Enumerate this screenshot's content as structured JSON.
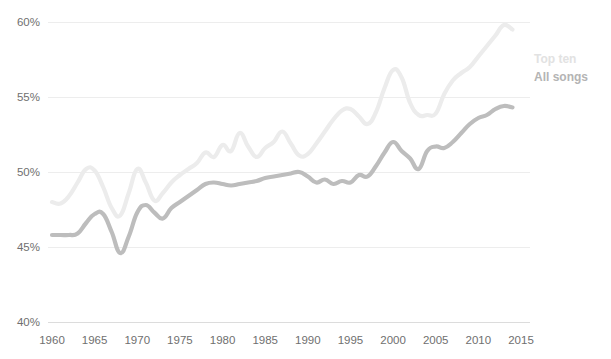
{
  "chart_data": {
    "type": "line",
    "title": "",
    "subtitle": "",
    "xlabel": "",
    "ylabel": "",
    "xlim": [
      1960,
      2016
    ],
    "ylim": [
      40,
      60
    ],
    "grid": true,
    "legend_position": "right",
    "x_ticks": [
      "1960",
      "1965",
      "1970",
      "1975",
      "1980",
      "1985",
      "1990",
      "1995",
      "2000",
      "2005",
      "2010",
      "2015"
    ],
    "x_tick_values": [
      1960,
      1965,
      1970,
      1975,
      1980,
      1985,
      1990,
      1995,
      2000,
      2005,
      2010,
      2015
    ],
    "y_ticks": [
      "40%",
      "45%",
      "50%",
      "55%",
      "60%"
    ],
    "y_tick_values": [
      40,
      45,
      50,
      55,
      60
    ],
    "x": [
      1960,
      1961,
      1962,
      1963,
      1964,
      1965,
      1966,
      1967,
      1968,
      1969,
      1970,
      1971,
      1972,
      1973,
      1974,
      1975,
      1976,
      1977,
      1978,
      1979,
      1980,
      1981,
      1982,
      1983,
      1984,
      1985,
      1986,
      1987,
      1988,
      1989,
      1990,
      1991,
      1992,
      1993,
      1994,
      1995,
      1996,
      1997,
      1998,
      1999,
      2000,
      2001,
      2002,
      2003,
      2004,
      2005,
      2006,
      2007,
      2008,
      2009,
      2010,
      2011,
      2012,
      2013,
      2014
    ],
    "series": [
      {
        "name": "Top ten",
        "color": "#ececec",
        "values": [
          48.0,
          47.9,
          48.4,
          49.3,
          50.2,
          50.1,
          49.0,
          47.6,
          47.1,
          48.6,
          50.2,
          49.3,
          48.1,
          48.6,
          49.3,
          49.8,
          50.2,
          50.6,
          51.3,
          51.0,
          51.8,
          51.4,
          52.6,
          51.7,
          51.0,
          51.6,
          52.0,
          52.7,
          51.9,
          51.1,
          51.2,
          51.9,
          52.7,
          53.5,
          54.1,
          54.2,
          53.7,
          53.2,
          54.0,
          55.6,
          56.8,
          56.3,
          54.6,
          53.8,
          53.8,
          53.9,
          55.2,
          56.1,
          56.6,
          57.0,
          57.7,
          58.4,
          59.1,
          59.8,
          59.5
        ]
      },
      {
        "name": "All songs",
        "color": "#bdbdbd",
        "values": [
          45.8,
          45.8,
          45.8,
          45.9,
          46.6,
          47.2,
          47.2,
          46.0,
          44.6,
          45.7,
          47.3,
          47.8,
          47.3,
          46.9,
          47.6,
          48.0,
          48.4,
          48.8,
          49.2,
          49.3,
          49.2,
          49.1,
          49.2,
          49.3,
          49.4,
          49.6,
          49.7,
          49.8,
          49.9,
          50.0,
          49.7,
          49.3,
          49.5,
          49.2,
          49.4,
          49.3,
          49.8,
          49.7,
          50.4,
          51.3,
          52.0,
          51.4,
          50.9,
          50.2,
          51.4,
          51.7,
          51.6,
          52.0,
          52.6,
          53.2,
          53.6,
          53.8,
          54.2,
          54.4,
          54.3
        ]
      }
    ],
    "legend": [
      {
        "label": "Top ten",
        "color": "#e2e2e2"
      },
      {
        "label": "All songs",
        "color": "#b4b4b4"
      }
    ],
    "colors": {
      "background": "#ffffff",
      "gridline": "#ededed",
      "baseline": "#dcdcdc",
      "tick_label": "#6f6f6f",
      "top_ten": "#ececec",
      "all_songs": "#bdbdbd"
    }
  }
}
